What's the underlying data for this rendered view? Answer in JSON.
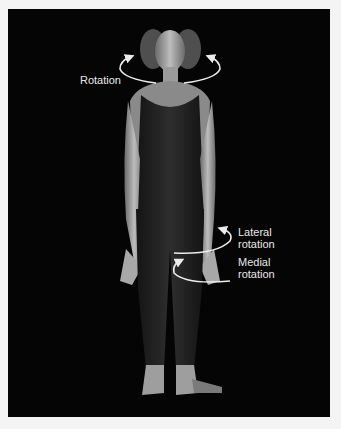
{
  "figure": {
    "background_color": "#050505",
    "label_color": "#e8e8e8",
    "labels": {
      "rotation": "Rotation",
      "lateral_rotation_line1": "Lateral",
      "lateral_rotation_line2": "rotation",
      "medial_rotation_line1": "Medial",
      "medial_rotation_line2": "rotation"
    }
  }
}
